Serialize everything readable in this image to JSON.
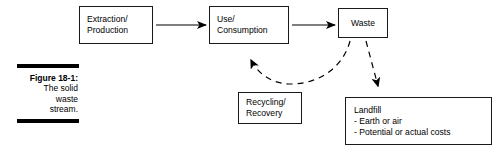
{
  "figure": {
    "caption_title": "Figure 18-1:",
    "caption_lines": [
      "The solid",
      "waste",
      "stream."
    ]
  },
  "diagram": {
    "type": "flowchart",
    "title": "The solid waste stream",
    "nodes": [
      {
        "id": "extraction",
        "lines": [
          "Extraction/",
          "Production"
        ]
      },
      {
        "id": "use",
        "lines": [
          "Use/",
          "Consumption"
        ]
      },
      {
        "id": "waste",
        "lines": [
          "Waste"
        ]
      },
      {
        "id": "recycling",
        "lines": [
          "Recycling/",
          "Recovery"
        ]
      },
      {
        "id": "landfill",
        "lines": [
          "Landfill",
          "- Earth or air",
          "- Potential or actual costs"
        ]
      }
    ],
    "edges": [
      {
        "from": "extraction",
        "to": "use",
        "style": "solid",
        "label": ""
      },
      {
        "from": "use",
        "to": "waste",
        "style": "solid",
        "label": ""
      },
      {
        "from": "waste",
        "to": "use",
        "style": "dashed",
        "label": ""
      },
      {
        "from": "waste",
        "to": "landfill",
        "style": "dashed",
        "label": ""
      }
    ],
    "colors": {
      "stroke": "#1a1a1a",
      "background": "#ffffff",
      "text": "#000000"
    }
  }
}
